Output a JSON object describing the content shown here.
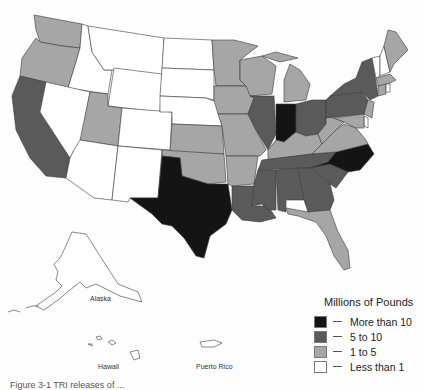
{
  "colors": {
    "more_than_10": "#141414",
    "5_to_10": "#5a5a5a",
    "1_to_5": "#a6a6a6",
    "less_than_1": "#ffffff"
  },
  "legend": {
    "title": "Millions of Pounds",
    "items": [
      {
        "label": "More than 10",
        "class": "more_than_10"
      },
      {
        "label": "5 to 10",
        "class": "5_to_10"
      },
      {
        "label": "1 to 5",
        "class": "1_to_5"
      },
      {
        "label": "Less than 1",
        "class": "less_than_1"
      }
    ]
  },
  "labels": {
    "alaska": "Alaska",
    "hawaii": "Hawaii",
    "puerto_rico": "Puerto Rico"
  },
  "caption": "Figure 3-1 TRI releases of ...",
  "states": {
    "WA": "1_to_5",
    "OR": "1_to_5",
    "CA": "5_to_10",
    "ID": "less_than_1",
    "NV": "less_than_1",
    "MT": "less_than_1",
    "WY": "less_than_1",
    "UT": "1_to_5",
    "AZ": "less_than_1",
    "CO": "less_than_1",
    "NM": "less_than_1",
    "ND": "less_than_1",
    "SD": "less_than_1",
    "NE": "less_than_1",
    "KS": "1_to_5",
    "OK": "1_to_5",
    "TX": "more_than_10",
    "MN": "1_to_5",
    "IA": "1_to_5",
    "MO": "1_to_5",
    "AR": "1_to_5",
    "LA": "5_to_10",
    "WI": "1_to_5",
    "IL": "5_to_10",
    "MI": "1_to_5",
    "IN": "more_than_10",
    "OH": "5_to_10",
    "KY": "1_to_5",
    "TN": "5_to_10",
    "MS": "5_to_10",
    "AL": "5_to_10",
    "GA": "5_to_10",
    "FL": "1_to_5",
    "SC": "5_to_10",
    "NC": "more_than_10",
    "VA": "1_to_5",
    "WV": "1_to_5",
    "PA": "5_to_10",
    "NY": "5_to_10",
    "VT": "less_than_1",
    "NH": "less_than_1",
    "ME": "1_to_5",
    "MA": "1_to_5",
    "CT": "1_to_5",
    "RI": "less_than_1",
    "NJ": "1_to_5",
    "DE": "less_than_1",
    "MD": "1_to_5",
    "AK": "less_than_1",
    "HI": "less_than_1",
    "PR": "less_than_1"
  }
}
